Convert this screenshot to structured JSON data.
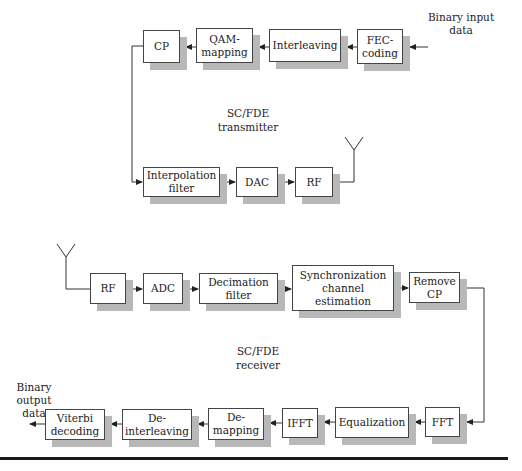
{
  "transmitter": {
    "title": "SC/FDE\ntransmitter",
    "input_label": "Binary input\ndata",
    "blocks": [
      {
        "id": "fec",
        "label": "FEC-\ncoding"
      },
      {
        "id": "interleaving",
        "label": "Interleaving"
      },
      {
        "id": "qam",
        "label": "QAM-\nmapping"
      },
      {
        "id": "cp",
        "label": "CP"
      },
      {
        "id": "interp",
        "label": "Interpolation\nfilter"
      },
      {
        "id": "dac",
        "label": "DAC"
      },
      {
        "id": "rf",
        "label": "RF"
      }
    ]
  },
  "receiver": {
    "title": "SC/FDE\nreceiver",
    "output_label": "Binary\noutput\ndata",
    "blocks": [
      {
        "id": "rf",
        "label": "RF"
      },
      {
        "id": "adc",
        "label": "ADC"
      },
      {
        "id": "decim",
        "label": "Decimation\nfilter"
      },
      {
        "id": "sync",
        "label": "Synchronization\nchannel\nestimation"
      },
      {
        "id": "removecp",
        "label": "Remove\nCP"
      },
      {
        "id": "fft",
        "label": "FFT"
      },
      {
        "id": "eq",
        "label": "Equalization"
      },
      {
        "id": "ifft",
        "label": "IFFT"
      },
      {
        "id": "demap",
        "label": "De-\nmapping"
      },
      {
        "id": "deint",
        "label": "De-\ninterleaving"
      },
      {
        "id": "viterbi",
        "label": "Viterbi\ndecoding"
      }
    ]
  }
}
